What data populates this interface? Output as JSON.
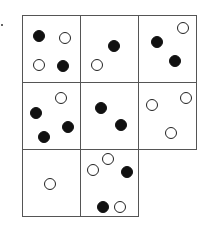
{
  "puzzle": {
    "grid": {
      "left": 22,
      "top": 15,
      "col_width": 58,
      "row_height": 67,
      "cols": 3,
      "rows": 3
    },
    "colors": {
      "black": "#111111",
      "white": "#ffffff",
      "line": "#555555"
    },
    "cells": [
      {
        "row": 0,
        "col": 0,
        "circles": [
          {
            "type": "black",
            "x": 16,
            "y": 20
          },
          {
            "type": "white",
            "x": 42,
            "y": 22
          },
          {
            "type": "white",
            "x": 16,
            "y": 49
          },
          {
            "type": "black",
            "x": 40,
            "y": 50
          }
        ]
      },
      {
        "row": 0,
        "col": 1,
        "circles": [
          {
            "type": "black",
            "x": 33,
            "y": 30
          },
          {
            "type": "white",
            "x": 16,
            "y": 49
          }
        ]
      },
      {
        "row": 0,
        "col": 2,
        "circles": [
          {
            "type": "white",
            "x": 44,
            "y": 12
          },
          {
            "type": "black",
            "x": 18,
            "y": 26
          },
          {
            "type": "black",
            "x": 36,
            "y": 45
          }
        ]
      },
      {
        "row": 1,
        "col": 0,
        "circles": [
          {
            "type": "white",
            "x": 38,
            "y": 15
          },
          {
            "type": "black",
            "x": 13,
            "y": 30
          },
          {
            "type": "black",
            "x": 45,
            "y": 44
          },
          {
            "type": "black",
            "x": 21,
            "y": 54
          }
        ]
      },
      {
        "row": 1,
        "col": 1,
        "circles": [
          {
            "type": "black",
            "x": 20,
            "y": 25
          },
          {
            "type": "black",
            "x": 40,
            "y": 42
          }
        ]
      },
      {
        "row": 1,
        "col": 2,
        "circles": [
          {
            "type": "white",
            "x": 47,
            "y": 15
          },
          {
            "type": "white",
            "x": 13,
            "y": 22
          },
          {
            "type": "white",
            "x": 32,
            "y": 50
          }
        ]
      },
      {
        "row": 2,
        "col": 0,
        "circles": [
          {
            "type": "white",
            "x": 27,
            "y": 34
          }
        ]
      },
      {
        "row": 2,
        "col": 1,
        "circles": [
          {
            "type": "white",
            "x": 27,
            "y": 9
          },
          {
            "type": "white",
            "x": 12,
            "y": 20
          },
          {
            "type": "black",
            "x": 46,
            "y": 22
          },
          {
            "type": "black",
            "x": 22,
            "y": 57
          },
          {
            "type": "white",
            "x": 39,
            "y": 57
          }
        ]
      }
    ],
    "missing_cell": {
      "row": 2,
      "col": 2
    }
  }
}
